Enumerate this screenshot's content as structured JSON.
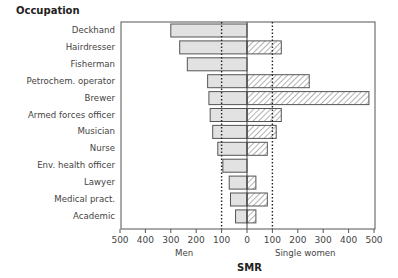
{
  "chart_data": {
    "type": "bar",
    "orientation": "horizontal-diverging",
    "title": "Occupation",
    "xlabel": "SMR",
    "left_label": "Men",
    "right_label": "Single women",
    "xlim_left": [
      500,
      0
    ],
    "xlim_right": [
      0,
      500
    ],
    "reference_lines": [
      100,
      100
    ],
    "tick_labels_left": [
      "500",
      "400",
      "300",
      "200",
      "100",
      "0"
    ],
    "tick_labels_right": [
      "100",
      "200",
      "300",
      "400",
      "500"
    ],
    "categories": [
      "Deckhand",
      "Hairdresser",
      "Fisherman",
      "Petrochem. operator",
      "Brewer",
      "Armed forces officer",
      "Musician",
      "Nurse",
      "Env. health officer",
      "Lawyer",
      "Medical pract.",
      "Academic"
    ],
    "series": [
      {
        "name": "Men",
        "values": [
          300,
          265,
          235,
          155,
          150,
          145,
          135,
          115,
          95,
          70,
          65,
          45
        ]
      },
      {
        "name": "Single women",
        "values": [
          null,
          135,
          null,
          245,
          480,
          135,
          115,
          80,
          null,
          35,
          80,
          35
        ]
      }
    ]
  }
}
